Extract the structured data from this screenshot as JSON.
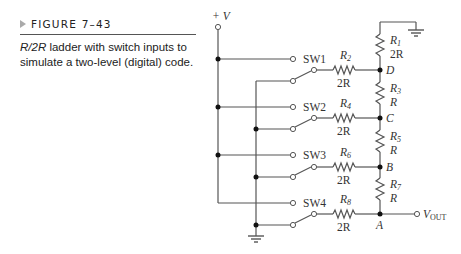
{
  "figure": {
    "label": "FIGURE 7–43",
    "caption_italic": "R/2R",
    "caption_rest": " ladder with switch inputs to simulate a two-level (digital) code."
  },
  "circuit": {
    "supply": "+ V",
    "output": "V",
    "output_sub": "OUT",
    "switches": [
      "SW1",
      "SW2",
      "SW3",
      "SW4"
    ],
    "nodes": [
      "D",
      "C",
      "B",
      "A"
    ],
    "series_resistors": [
      {
        "name": "R",
        "sub": "1",
        "value": "2R"
      },
      {
        "name": "R",
        "sub": "3",
        "value": "R"
      },
      {
        "name": "R",
        "sub": "5",
        "value": "R"
      },
      {
        "name": "R",
        "sub": "7",
        "value": "R"
      }
    ],
    "input_resistors": [
      {
        "name": "R",
        "sub": "2",
        "value": "2R"
      },
      {
        "name": "R",
        "sub": "4",
        "value": "2R"
      },
      {
        "name": "R",
        "sub": "6",
        "value": "2R"
      },
      {
        "name": "R",
        "sub": "8",
        "value": "2R"
      }
    ],
    "colors": {
      "wire": "#555555",
      "dot": "#111111"
    }
  }
}
